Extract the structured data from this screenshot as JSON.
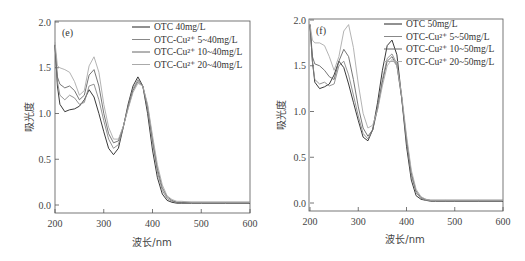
{
  "chart_data": [
    {
      "type": "line",
      "panel": "(e)",
      "xlabel": "波长/nm",
      "ylabel": "吸光度",
      "xlim": [
        200,
        600
      ],
      "ylim": [
        -0.1,
        2.0
      ],
      "xticks": [
        200,
        300,
        400,
        500,
        600
      ],
      "yticks": [
        0.0,
        0.5,
        1.0,
        1.5,
        2.0
      ],
      "grid": false,
      "legend_position": "upper right",
      "series": [
        {
          "name": "OTC 40mg/L",
          "color": "#222222",
          "x": [
            200,
            205,
            210,
            220,
            230,
            240,
            250,
            260,
            270,
            280,
            290,
            300,
            310,
            320,
            330,
            340,
            350,
            360,
            370,
            380,
            390,
            400,
            410,
            420,
            430,
            440,
            450,
            460,
            480,
            500,
            550,
            600
          ],
          "y": [
            1.75,
            1.3,
            1.1,
            1.02,
            1.04,
            1.05,
            1.08,
            1.15,
            1.26,
            1.18,
            1.0,
            0.8,
            0.62,
            0.55,
            0.62,
            0.85,
            1.1,
            1.3,
            1.4,
            1.3,
            1.0,
            0.6,
            0.3,
            0.12,
            0.05,
            0.03,
            0.02,
            0.02,
            0.02,
            0.02,
            0.02,
            0.02
          ]
        },
        {
          "name": "OTC-Cu²⁺ 5~40mg/L",
          "color": "#888888",
          "x": [
            200,
            205,
            210,
            220,
            230,
            240,
            250,
            260,
            270,
            280,
            290,
            300,
            310,
            320,
            330,
            340,
            350,
            360,
            370,
            380,
            390,
            400,
            410,
            420,
            430,
            440,
            450,
            460,
            480,
            500,
            550,
            600
          ],
          "y": [
            1.75,
            1.35,
            1.2,
            1.15,
            1.2,
            1.17,
            1.1,
            1.12,
            1.3,
            1.32,
            1.15,
            0.92,
            0.72,
            0.62,
            0.66,
            0.85,
            1.08,
            1.27,
            1.37,
            1.3,
            1.05,
            0.68,
            0.36,
            0.16,
            0.07,
            0.04,
            0.03,
            0.03,
            0.03,
            0.03,
            0.03,
            0.03
          ]
        },
        {
          "name": "OTC-Cu²⁺ 10~40mg/L",
          "color": "#666666",
          "x": [
            200,
            205,
            210,
            220,
            230,
            240,
            250,
            260,
            270,
            280,
            290,
            300,
            310,
            320,
            330,
            340,
            350,
            360,
            370,
            380,
            390,
            400,
            410,
            420,
            430,
            440,
            450,
            460,
            480,
            500,
            550,
            600
          ],
          "y": [
            1.75,
            1.4,
            1.32,
            1.28,
            1.3,
            1.25,
            1.15,
            1.2,
            1.42,
            1.48,
            1.3,
            1.0,
            0.78,
            0.68,
            0.7,
            0.86,
            1.06,
            1.25,
            1.35,
            1.3,
            1.08,
            0.72,
            0.4,
            0.19,
            0.09,
            0.05,
            0.03,
            0.03,
            0.03,
            0.03,
            0.03,
            0.03
          ]
        },
        {
          "name": "OTC-Cu²⁺ 20~40mg/L",
          "color": "#aaaaaa",
          "x": [
            200,
            205,
            210,
            220,
            230,
            240,
            250,
            260,
            270,
            280,
            290,
            300,
            310,
            320,
            330,
            340,
            350,
            360,
            370,
            380,
            390,
            400,
            410,
            420,
            430,
            440,
            450,
            460,
            480,
            500,
            550,
            600
          ],
          "y": [
            1.78,
            1.52,
            1.5,
            1.48,
            1.45,
            1.35,
            1.2,
            1.25,
            1.52,
            1.62,
            1.45,
            1.1,
            0.85,
            0.72,
            0.72,
            0.86,
            1.05,
            1.23,
            1.33,
            1.3,
            1.1,
            0.76,
            0.44,
            0.22,
            0.1,
            0.06,
            0.04,
            0.04,
            0.03,
            0.03,
            0.03,
            0.03
          ]
        }
      ]
    },
    {
      "type": "line",
      "panel": "(f)",
      "xlabel": "波长/nm",
      "ylabel": "吸光度",
      "xlim": [
        200,
        600
      ],
      "ylim": [
        -0.1,
        2.0
      ],
      "xticks": [
        200,
        300,
        400,
        500,
        600
      ],
      "yticks": [
        0.0,
        0.5,
        1.0,
        1.5,
        2.0
      ],
      "grid": false,
      "legend_position": "upper right",
      "series": [
        {
          "name": "OTC 50mg/L",
          "color": "#222222",
          "x": [
            200,
            205,
            210,
            220,
            230,
            240,
            250,
            260,
            270,
            280,
            290,
            300,
            310,
            320,
            330,
            340,
            350,
            360,
            370,
            380,
            390,
            400,
            410,
            420,
            430,
            440,
            450,
            460,
            480,
            500,
            550,
            600
          ],
          "y": [
            1.95,
            1.55,
            1.32,
            1.25,
            1.27,
            1.3,
            1.4,
            1.55,
            1.48,
            1.3,
            1.1,
            0.9,
            0.72,
            0.68,
            0.8,
            1.1,
            1.45,
            1.72,
            1.78,
            1.62,
            1.15,
            0.62,
            0.25,
            0.08,
            0.04,
            0.03,
            0.02,
            0.02,
            0.02,
            0.02,
            0.02,
            0.02
          ]
        },
        {
          "name": "OTC-Cu²⁺ 5~50mg/L",
          "color": "#888888",
          "x": [
            200,
            205,
            210,
            220,
            230,
            240,
            250,
            260,
            270,
            280,
            290,
            300,
            310,
            320,
            330,
            340,
            350,
            360,
            370,
            380,
            390,
            400,
            410,
            420,
            430,
            440,
            450,
            460,
            480,
            500,
            550,
            600
          ],
          "y": [
            1.95,
            1.55,
            1.35,
            1.3,
            1.32,
            1.28,
            1.3,
            1.5,
            1.55,
            1.4,
            1.18,
            0.95,
            0.76,
            0.7,
            0.8,
            1.05,
            1.35,
            1.58,
            1.63,
            1.52,
            1.15,
            0.68,
            0.3,
            0.11,
            0.05,
            0.03,
            0.03,
            0.03,
            0.03,
            0.03,
            0.03,
            0.03
          ]
        },
        {
          "name": "OTC-Cu²⁺ 10~50mg/L",
          "color": "#666666",
          "x": [
            200,
            205,
            210,
            220,
            230,
            240,
            250,
            260,
            270,
            280,
            290,
            300,
            310,
            320,
            330,
            340,
            350,
            360,
            370,
            380,
            390,
            400,
            410,
            420,
            430,
            440,
            450,
            460,
            480,
            500,
            550,
            600
          ],
          "y": [
            1.95,
            1.6,
            1.52,
            1.5,
            1.45,
            1.38,
            1.35,
            1.55,
            1.68,
            1.6,
            1.35,
            1.05,
            0.82,
            0.73,
            0.8,
            1.03,
            1.32,
            1.55,
            1.6,
            1.5,
            1.15,
            0.7,
            0.33,
            0.13,
            0.06,
            0.04,
            0.03,
            0.03,
            0.03,
            0.03,
            0.03,
            0.03
          ]
        },
        {
          "name": "OTC-Cu²⁺ 20~50mg/L",
          "color": "#aaaaaa",
          "x": [
            200,
            205,
            210,
            220,
            230,
            240,
            250,
            260,
            270,
            280,
            290,
            300,
            310,
            320,
            330,
            340,
            350,
            360,
            370,
            380,
            390,
            400,
            410,
            420,
            430,
            440,
            450,
            460,
            480,
            500,
            550,
            600
          ],
          "y": [
            1.95,
            1.78,
            1.75,
            1.75,
            1.72,
            1.6,
            1.45,
            1.6,
            1.88,
            1.95,
            1.7,
            1.3,
            0.98,
            0.82,
            0.85,
            1.02,
            1.28,
            1.5,
            1.57,
            1.5,
            1.18,
            0.74,
            0.36,
            0.15,
            0.07,
            0.04,
            0.03,
            0.03,
            0.03,
            0.03,
            0.03,
            0.03
          ]
        }
      ]
    }
  ],
  "panels": [
    {
      "label": "(e)",
      "xlabel": "波长/nm",
      "ylabel": "吸光度",
      "legend": [
        "OTC 40mg/L",
        "OTC-Cu²⁺ 5~40mg/L",
        "OTC-Cu²⁺ 10~40mg/L",
        "OTC-Cu²⁺ 20~40mg/L"
      ]
    },
    {
      "label": "(f)",
      "xlabel": "波长/nm",
      "ylabel": "吸光度",
      "legend": [
        "OTC 50mg/L",
        "OTC-Cu²⁺ 5~50mg/L",
        "OTC-Cu²⁺ 10~50mg/L",
        "OTC-Cu²⁺ 20~50mg/L"
      ]
    }
  ]
}
